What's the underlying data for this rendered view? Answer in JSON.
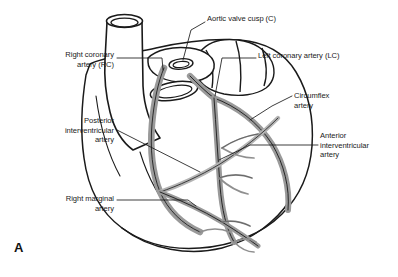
{
  "figure": {
    "letter": "A",
    "background_color": "#ffffff",
    "outline_color": "#1a1a1a",
    "vessel_fill_color": "#9a9a9a",
    "vessel_fill_light": "#c9c9c9",
    "leader_line_color": "#1a1a1a",
    "text_color": "#1a1a1a"
  },
  "labels": {
    "aortic_valve_cusp": "Aortic valve cusp (C)",
    "right_coronary_artery": "Right coronary\nartery (RC)",
    "left_coronary_artery": "Left coronary artery (LC)",
    "circumflex_artery": "Circumflex\nartery",
    "posterior_interventricular_artery": "Posterior\ninterventricular\nartery",
    "anterior_interventricular_artery": "Anterior\ninterventricular\nartery",
    "right_marginal_artery": "Right marginal\nartery"
  },
  "structures": [
    {
      "name": "aorta",
      "type": "great-vessel"
    },
    {
      "name": "left-atrial-appendage",
      "type": "chamber"
    },
    {
      "name": "right-ventricle",
      "type": "chamber"
    },
    {
      "name": "left-ventricle",
      "type": "chamber"
    },
    {
      "name": "pulmonary-trunk-stump",
      "type": "great-vessel"
    },
    {
      "name": "aortic-valve-cusp",
      "type": "valve"
    },
    {
      "name": "right-coronary-artery",
      "type": "artery"
    },
    {
      "name": "left-coronary-artery",
      "type": "artery"
    },
    {
      "name": "circumflex-artery",
      "type": "artery"
    },
    {
      "name": "anterior-interventricular-artery",
      "type": "artery"
    },
    {
      "name": "posterior-interventricular-artery",
      "type": "artery"
    },
    {
      "name": "right-marginal-artery",
      "type": "artery"
    }
  ]
}
